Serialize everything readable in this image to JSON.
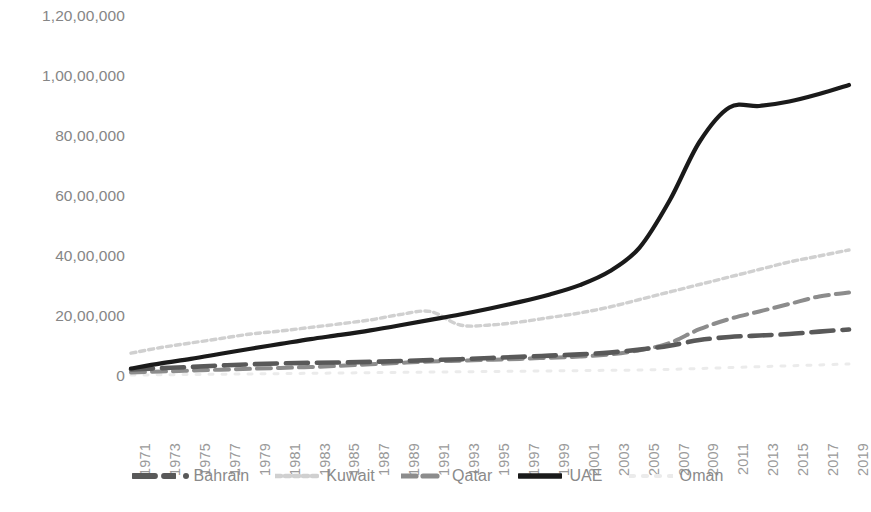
{
  "chart_data": {
    "type": "line",
    "title": "",
    "subtitle": "",
    "xlabel": "",
    "ylabel": "",
    "grid": false,
    "legend_position": "bottom",
    "xlim": [
      1971,
      2019
    ],
    "ylim": [
      0,
      12000000
    ],
    "y_ticks": [
      0,
      2000000,
      4000000,
      6000000,
      8000000,
      10000000,
      12000000
    ],
    "y_tick_labels": [
      "0",
      "20,00,000",
      "40,00,000",
      "60,00,000",
      "80,00,000",
      "1,00,00,000",
      "1,20,00,000"
    ],
    "x": [
      1971,
      1973,
      1975,
      1977,
      1979,
      1981,
      1983,
      1985,
      1987,
      1989,
      1991,
      1993,
      1995,
      1997,
      1999,
      2001,
      2003,
      2005,
      2007,
      2009,
      2011,
      2013,
      2015,
      2017,
      2019
    ],
    "x_tick_labels": [
      "1971",
      "1973",
      "1975",
      "1977",
      "1979",
      "1981",
      "1983",
      "1985",
      "1987",
      "1989",
      "1991",
      "1993",
      "1995",
      "1997",
      "1999",
      "2001",
      "2003",
      "2005",
      "2007",
      "2009",
      "2011",
      "2013",
      "2015",
      "2017",
      "2019"
    ],
    "series": [
      {
        "name": "Bahrain",
        "color": "#595959",
        "style": "long-dash",
        "marker": "dot",
        "values": [
          220000,
          260000,
          300000,
          350000,
          390000,
          420000,
          440000,
          450000,
          470000,
          500000,
          530000,
          560000,
          600000,
          640000,
          680000,
          720000,
          780000,
          880000,
          1010000,
          1200000,
          1300000,
          1350000,
          1400000,
          1480000,
          1550000
        ]
      },
      {
        "name": "Kuwait",
        "color": "#d0d0d0",
        "style": "fine-dot",
        "marker": "none",
        "values": [
          760000,
          950000,
          1100000,
          1250000,
          1400000,
          1500000,
          1620000,
          1740000,
          1870000,
          2050000,
          2150000,
          1700000,
          1700000,
          1800000,
          1950000,
          2100000,
          2300000,
          2550000,
          2800000,
          3050000,
          3300000,
          3550000,
          3800000,
          4000000,
          4200000
        ]
      },
      {
        "name": "Qatar",
        "color": "#8c8c8c",
        "style": "medium-dash",
        "marker": "none",
        "values": [
          120000,
          150000,
          180000,
          210000,
          240000,
          270000,
          300000,
          340000,
          390000,
          440000,
          480000,
          510000,
          540000,
          570000,
          610000,
          650000,
          720000,
          860000,
          1100000,
          1560000,
          1900000,
          2150000,
          2400000,
          2650000,
          2780000
        ]
      },
      {
        "name": "UAE",
        "color": "#1a1a1a",
        "style": "solid",
        "marker": "none",
        "values": [
          250000,
          420000,
          570000,
          740000,
          910000,
          1070000,
          1230000,
          1370000,
          1520000,
          1690000,
          1870000,
          2050000,
          2250000,
          2470000,
          2720000,
          3030000,
          3490000,
          4280000,
          5840000,
          7800000,
          8950000,
          9000000,
          9150000,
          9400000,
          9700000
        ]
      },
      {
        "name": "Oman",
        "color": "#ebebeb",
        "style": "sparse-dot",
        "marker": "none",
        "values": [
          30000,
          40000,
          50000,
          60000,
          70000,
          80000,
          90000,
          100000,
          110000,
          120000,
          130000,
          140000,
          150000,
          160000,
          170000,
          180000,
          190000,
          200000,
          220000,
          250000,
          280000,
          310000,
          340000,
          370000,
          400000
        ]
      }
    ]
  },
  "legend": {
    "items": [
      {
        "label": "Bahrain",
        "color": "#595959",
        "style": "long-dash",
        "marker": "dot"
      },
      {
        "label": "Kuwait",
        "color": "#d0d0d0",
        "style": "fine-dot",
        "marker": "none"
      },
      {
        "label": "Qatar",
        "color": "#8c8c8c",
        "style": "medium-dash",
        "marker": "none"
      },
      {
        "label": "UAE",
        "color": "#1a1a1a",
        "style": "solid",
        "marker": "none"
      },
      {
        "label": "Oman",
        "color": "#ebebeb",
        "style": "sparse-dot",
        "marker": "none"
      }
    ]
  }
}
